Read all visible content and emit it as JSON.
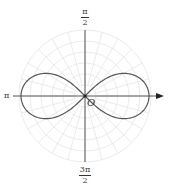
{
  "diagram": {
    "title": "",
    "curve": "lemniscate r^2 = a^2 cos(2θ)",
    "colors": {
      "curve": "#555555",
      "axis": "#444444",
      "grid": "#dddddd",
      "background": "#ffffff"
    },
    "labels": {
      "top": {
        "num": "π",
        "den": "2"
      },
      "bottom": {
        "num": "3π",
        "den": "2"
      },
      "left": "π",
      "origin": "O"
    },
    "grid": {
      "circle_count": 6,
      "radial_step_deg": 15
    }
  }
}
